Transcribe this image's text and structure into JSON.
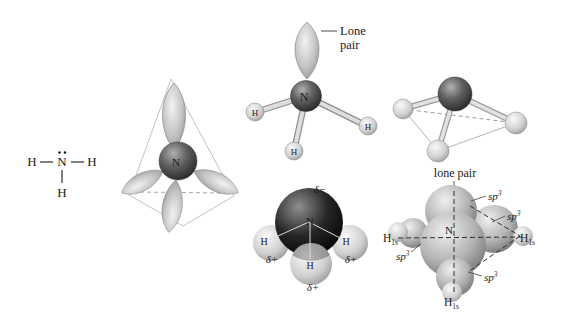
{
  "figures": {
    "lewis_structure": {
      "h_left": "H",
      "nitrogen": "N",
      "h_right": "H",
      "h_bottom": "H"
    },
    "hybrid_orbital_model": {
      "nitrogen": "N"
    },
    "ball_and_stick_model": {
      "lone_pair_label_line1": "Lone",
      "lone_pair_label_line2": "pair",
      "nitrogen": "N",
      "h_left": "H",
      "h_right": "H",
      "h_bottom": "H"
    },
    "electrostatic_model": {
      "nitrogen": "N",
      "h_left": "H",
      "h_right": "H",
      "h_bottom": "H",
      "delta_minus": "δ−",
      "delta_plus_left": "δ+",
      "delta_plus_right": "δ+",
      "delta_plus_bottom": "δ+"
    },
    "orbital_overlap_model": {
      "lone_pair_label": "lone pair",
      "nitrogen": "N",
      "sp3_base": "sp",
      "sp3_sup": "3",
      "h_base": "H",
      "h_sub": "1s"
    }
  },
  "colors": {
    "background": "#ffffff",
    "nitrogen_sphere_dark": "#3a3a3a",
    "hydrogen_sphere_light": "#cdcdcd",
    "orbital_gray": "#a8a8a8",
    "electron_rich_black": "#0a0a0a",
    "label_text": "#1a1a1a",
    "muted_label_text": "#555555",
    "frame_line": "#c0c0c0"
  }
}
